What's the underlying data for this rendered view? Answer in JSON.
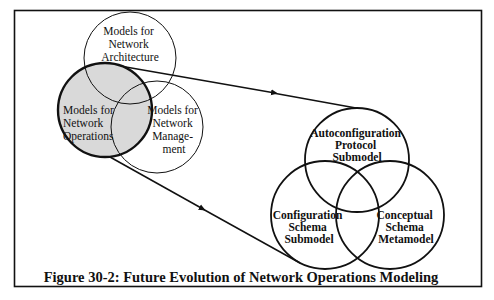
{
  "figure": {
    "caption": "Figure 30-2: Future Evolution of Network Operations Modeling",
    "colors": {
      "stroke": "#111111",
      "shaded_fill": "#d9d9d9",
      "background": "#ffffff"
    }
  },
  "current_models": {
    "architecture": {
      "lines": [
        "Models for",
        "Network",
        "Architecture"
      ]
    },
    "operations": {
      "lines": [
        "Models for",
        "Network",
        "Operations"
      ],
      "highlighted": true
    },
    "management": {
      "lines": [
        "Models for",
        "Network",
        "Manage-",
        "ment"
      ]
    }
  },
  "future_submodels": {
    "autoconfiguration": {
      "lines": [
        "Autoconfiguration",
        "Protocol",
        "Submodel"
      ]
    },
    "configuration_schema": {
      "lines": [
        "Configuration",
        "Schema",
        "Submodel"
      ]
    },
    "conceptual_schema": {
      "lines": [
        "Conceptual",
        "Schema",
        "Metamodel"
      ]
    }
  }
}
